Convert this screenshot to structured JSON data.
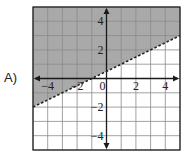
{
  "option_label": "A)",
  "colors": {
    "shade": "#a9a9a9",
    "grid": "#8a8a8a",
    "axis": "#1a1a1a",
    "line": "#222222",
    "background": "#ffffff"
  },
  "chart_data": {
    "type": "line",
    "title": "",
    "xlabel": "",
    "ylabel": "",
    "xlim": [
      -5,
      5
    ],
    "ylim": [
      -5,
      5
    ],
    "grid": true,
    "x_ticks": [
      "-4",
      "-2",
      "0",
      "2",
      "4"
    ],
    "y_ticks": [
      "4",
      "2",
      "-2",
      "-4"
    ],
    "boundary_line": {
      "slope": 0.5,
      "intercept": 0.5,
      "style": "dashed",
      "points": [
        [
          -5,
          -2
        ],
        [
          5,
          3
        ]
      ]
    },
    "shaded_region": "above",
    "inequality": "y > 0.5x + 0.5"
  }
}
